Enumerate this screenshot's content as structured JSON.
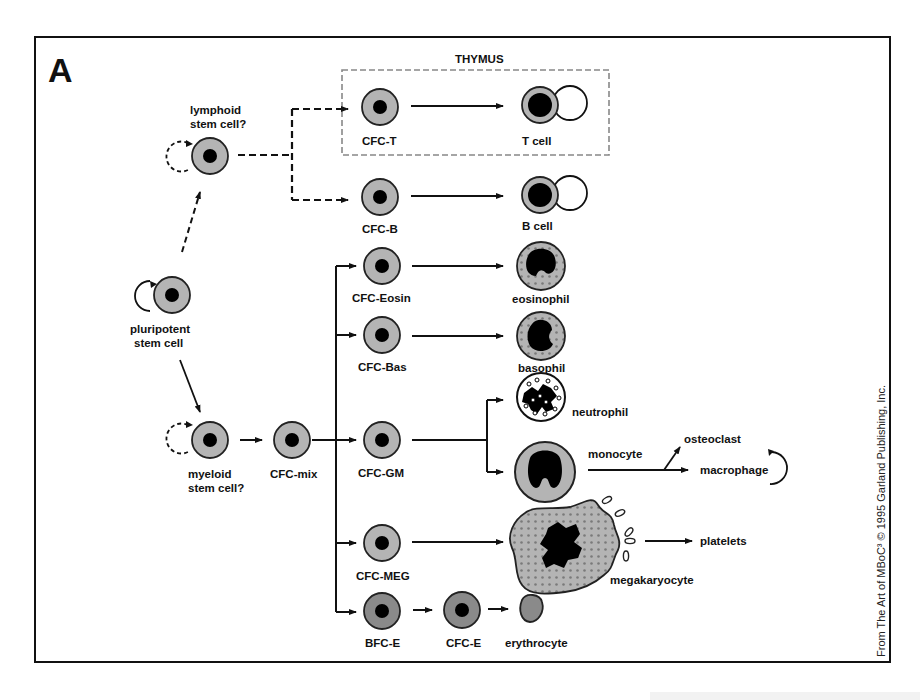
{
  "figure": {
    "panel_label": "A",
    "credit": "From The Art of MBoC³ © 1995 Garland Publishing, Inc.",
    "region_label": "THYMUS",
    "colors": {
      "cytoplasm": "#b4b4b4",
      "erythroid_cytoplasm": "#8a8a8a",
      "nucleus": "#000000",
      "outline": "#222222",
      "background": "#ffffff"
    }
  },
  "cells": {
    "pluripotent": {
      "label_line1": "pluripotent",
      "label_line2": "stem cell"
    },
    "lymphoid": {
      "label_line1": "lymphoid",
      "label_line2": "stem cell?"
    },
    "myeloid": {
      "label_line1": "myeloid",
      "label_line2": "stem cell?"
    },
    "cfc_mix": {
      "label": "CFC-mix"
    },
    "cfc_t": {
      "label": "CFC-T"
    },
    "cfc_b": {
      "label": "CFC-B"
    },
    "cfc_eosin": {
      "label": "CFC-Eosin"
    },
    "cfc_bas": {
      "label": "CFC-Bas"
    },
    "cfc_gm": {
      "label": "CFC-GM"
    },
    "cfc_meg": {
      "label": "CFC-MEG"
    },
    "bfc_e": {
      "label": "BFC-E"
    },
    "cfc_e": {
      "label": "CFC-E"
    },
    "t_cell": {
      "label": "T cell"
    },
    "b_cell": {
      "label": "B cell"
    },
    "eosinophil": {
      "label": "eosinophil"
    },
    "basophil": {
      "label": "basophil"
    },
    "neutrophil": {
      "label": "neutrophil"
    },
    "monocyte": {
      "label": "monocyte"
    },
    "osteoclast": {
      "label": "osteoclast"
    },
    "macrophage": {
      "label": "macrophage"
    },
    "megakaryocyte": {
      "label": "megakaryocyte"
    },
    "platelets": {
      "label": "platelets"
    },
    "erythrocyte": {
      "label": "erythrocyte"
    }
  }
}
